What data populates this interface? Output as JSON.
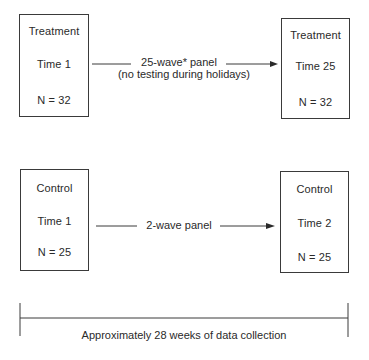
{
  "diagram": {
    "groups": [
      {
        "name": "treatment",
        "start": {
          "group": "Treatment",
          "time": "Time 1",
          "n": "N = 32"
        },
        "end": {
          "group": "Treatment",
          "time": "Time 25",
          "n": "N = 32"
        },
        "arrow": {
          "label_line1": "25-wave* panel",
          "label_line2": "(no testing during holidays)"
        }
      },
      {
        "name": "control",
        "start": {
          "group": "Control",
          "time": "Time 1",
          "n": "N = 25"
        },
        "end": {
          "group": "Control",
          "time": "Time 2",
          "n": "N = 25"
        },
        "arrow": {
          "label_line1": "2-wave panel"
        }
      }
    ],
    "timeline": {
      "caption": "Approximately 28 weeks of data collection"
    },
    "colors": {
      "line": "#3a3a3a",
      "text": "#2a2a2a",
      "background": "#ffffff"
    }
  }
}
